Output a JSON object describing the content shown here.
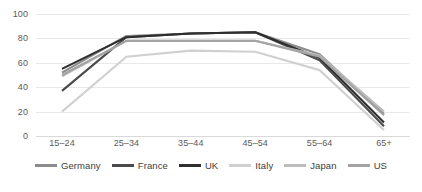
{
  "chart_data": {
    "type": "line",
    "title": "",
    "xlabel": "",
    "ylabel": "",
    "ylim": [
      0,
      100
    ],
    "yticks": [
      0,
      20,
      40,
      60,
      80,
      100
    ],
    "grid": true,
    "legend_position": "bottom",
    "categories": [
      "15–24",
      "25–34",
      "35–44",
      "45–54",
      "55–64",
      "65+"
    ],
    "series": [
      {
        "name": "Germany",
        "color": "#8c8c8c",
        "values": [
          52,
          82,
          84,
          85,
          67,
          18
        ]
      },
      {
        "name": "France",
        "color": "#4a4a4a",
        "values": [
          37,
          81,
          84,
          85,
          62,
          8
        ]
      },
      {
        "name": "UK",
        "color": "#2f2f2f",
        "values": [
          55,
          81,
          84,
          85,
          64,
          11
        ]
      },
      {
        "name": "Italy",
        "color": "#d0d0d0",
        "values": [
          20,
          65,
          70,
          69,
          54,
          5
        ]
      },
      {
        "name": "Japan",
        "color": "#bdbdbd",
        "values": [
          49,
          78,
          78,
          78,
          66,
          20
        ]
      },
      {
        "name": "US",
        "color": "#a3a3a3",
        "values": [
          50,
          78,
          78,
          78,
          65,
          17
        ]
      }
    ]
  },
  "legend": {
    "items": [
      {
        "label": "Germany"
      },
      {
        "label": "France"
      },
      {
        "label": "UK"
      },
      {
        "label": "Italy"
      },
      {
        "label": "Japan"
      },
      {
        "label": "US"
      }
    ]
  },
  "axes": {
    "y_labels": [
      "100",
      "80",
      "60",
      "40",
      "20",
      "0"
    ],
    "x_labels": [
      "15–24",
      "25–34",
      "35–44",
      "45–54",
      "55–64",
      "65+"
    ]
  },
  "colors": {
    "grid": "#e9e9e9",
    "axis_text": "#5a5a5a",
    "legend_text": "#3d3d3d",
    "background": "#ffffff"
  }
}
